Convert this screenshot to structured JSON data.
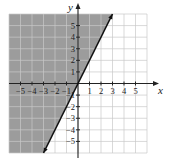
{
  "chart_data": {
    "type": "line",
    "title": "",
    "xlabel": "x",
    "ylabel": "y",
    "xlim": [
      -6,
      6
    ],
    "ylim": [
      -6,
      6
    ],
    "grid": true,
    "x_ticks": [
      -5,
      -4,
      -3,
      -2,
      -1,
      1,
      2,
      3,
      4,
      5
    ],
    "y_ticks": [
      -5,
      -4,
      -3,
      -2,
      -1,
      1,
      2,
      3,
      4,
      5
    ],
    "x_tick_labels": [
      "−5",
      "−4",
      "−3",
      "−2",
      "−1",
      "1",
      "2",
      "3",
      "4",
      "5"
    ],
    "y_tick_labels": [
      "−5",
      "−4",
      "−3",
      "−2",
      "−1",
      "1",
      "2",
      "3",
      "4",
      "5"
    ],
    "series": [
      {
        "name": "boundary line",
        "equation": "y = 2x",
        "style": "solid",
        "x": [
          -3,
          3
        ],
        "y": [
          -6,
          6
        ]
      }
    ],
    "shaded_region": {
      "description": "region left of / above line y = 2x",
      "inequality": "y > 2x",
      "color": "#9a9a9a"
    }
  },
  "colors": {
    "shade": "#9c9c9c",
    "grid": "#c8c8c8",
    "axis": "#222222",
    "line": "#111111"
  }
}
